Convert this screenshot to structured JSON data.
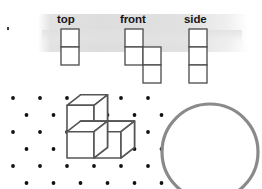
{
  "figure": {
    "views": [
      {
        "id": "top",
        "label": "top",
        "description": "one square wide, two squares tall",
        "columns": 1,
        "rows": 2,
        "cells": [
          [
            0,
            0
          ],
          [
            0,
            1
          ]
        ],
        "origin_x": 61,
        "origin_y": 29,
        "cell_size": 18
      },
      {
        "id": "front",
        "label": "front",
        "description": "staircase of four squares: one top-left, two in middle row, one bottom-right",
        "columns": 2,
        "rows": 3,
        "cells": [
          [
            0,
            0
          ],
          [
            0,
            1
          ],
          [
            1,
            1
          ],
          [
            1,
            2
          ]
        ],
        "origin_x": 125,
        "origin_y": 29,
        "cell_size": 18
      },
      {
        "id": "side",
        "label": "side",
        "description": "one square wide, three squares tall",
        "columns": 1,
        "rows": 3,
        "cells": [
          [
            0,
            0
          ],
          [
            0,
            1
          ],
          [
            0,
            2
          ]
        ],
        "origin_x": 189,
        "origin_y": 29,
        "cell_size": 18
      }
    ],
    "dot_grid": {
      "description": "isometric dot lattice with alternating row offsets",
      "dot_color": "#111111",
      "dot_radius": 1.9,
      "columns": 6,
      "rows": 6,
      "spacing_x": 27,
      "spacing_y": 17,
      "origin_x": 13,
      "origin_y": 98,
      "row_offset_x": 13.5
    },
    "cube_figure": {
      "description": "isometric stack of three cubes: one cube on the upper left, two cubes below it",
      "cube_count": 3,
      "line_color": "#555555",
      "line_width": 1.6,
      "face_color": "#ffffff"
    },
    "circle": {
      "description": "large gray circle outline, cropped by the bottom edge",
      "center_x": 210,
      "center_y": 152,
      "radius": 48,
      "stroke_color": "#8a8a8a",
      "stroke_width": 3.2
    },
    "artifact": {
      "description": "small dark speck near the upper-left corner"
    }
  },
  "colors": {
    "band_gray": "#dddddd",
    "label_text": "#16161a",
    "square_outline": "#4a4a4a",
    "dot": "#111111",
    "cube_line": "#555555",
    "circle_stroke": "#8a8a8a",
    "background": "#ffffff"
  }
}
